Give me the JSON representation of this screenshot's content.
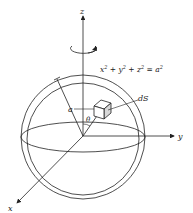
{
  "figure": {
    "axes": {
      "x": "x",
      "y": "y",
      "z": "z"
    },
    "equation": {
      "base": "x",
      "terms": [
        "x",
        "y",
        "z",
        "a"
      ],
      "text": "x² + y² + z² = a²"
    },
    "labels": {
      "radius": "a",
      "angle": "θ",
      "surface_element": "dS"
    },
    "colors": {
      "stroke": "#222222",
      "element_fill": "#d8d8d8",
      "background": "#ffffff"
    }
  }
}
